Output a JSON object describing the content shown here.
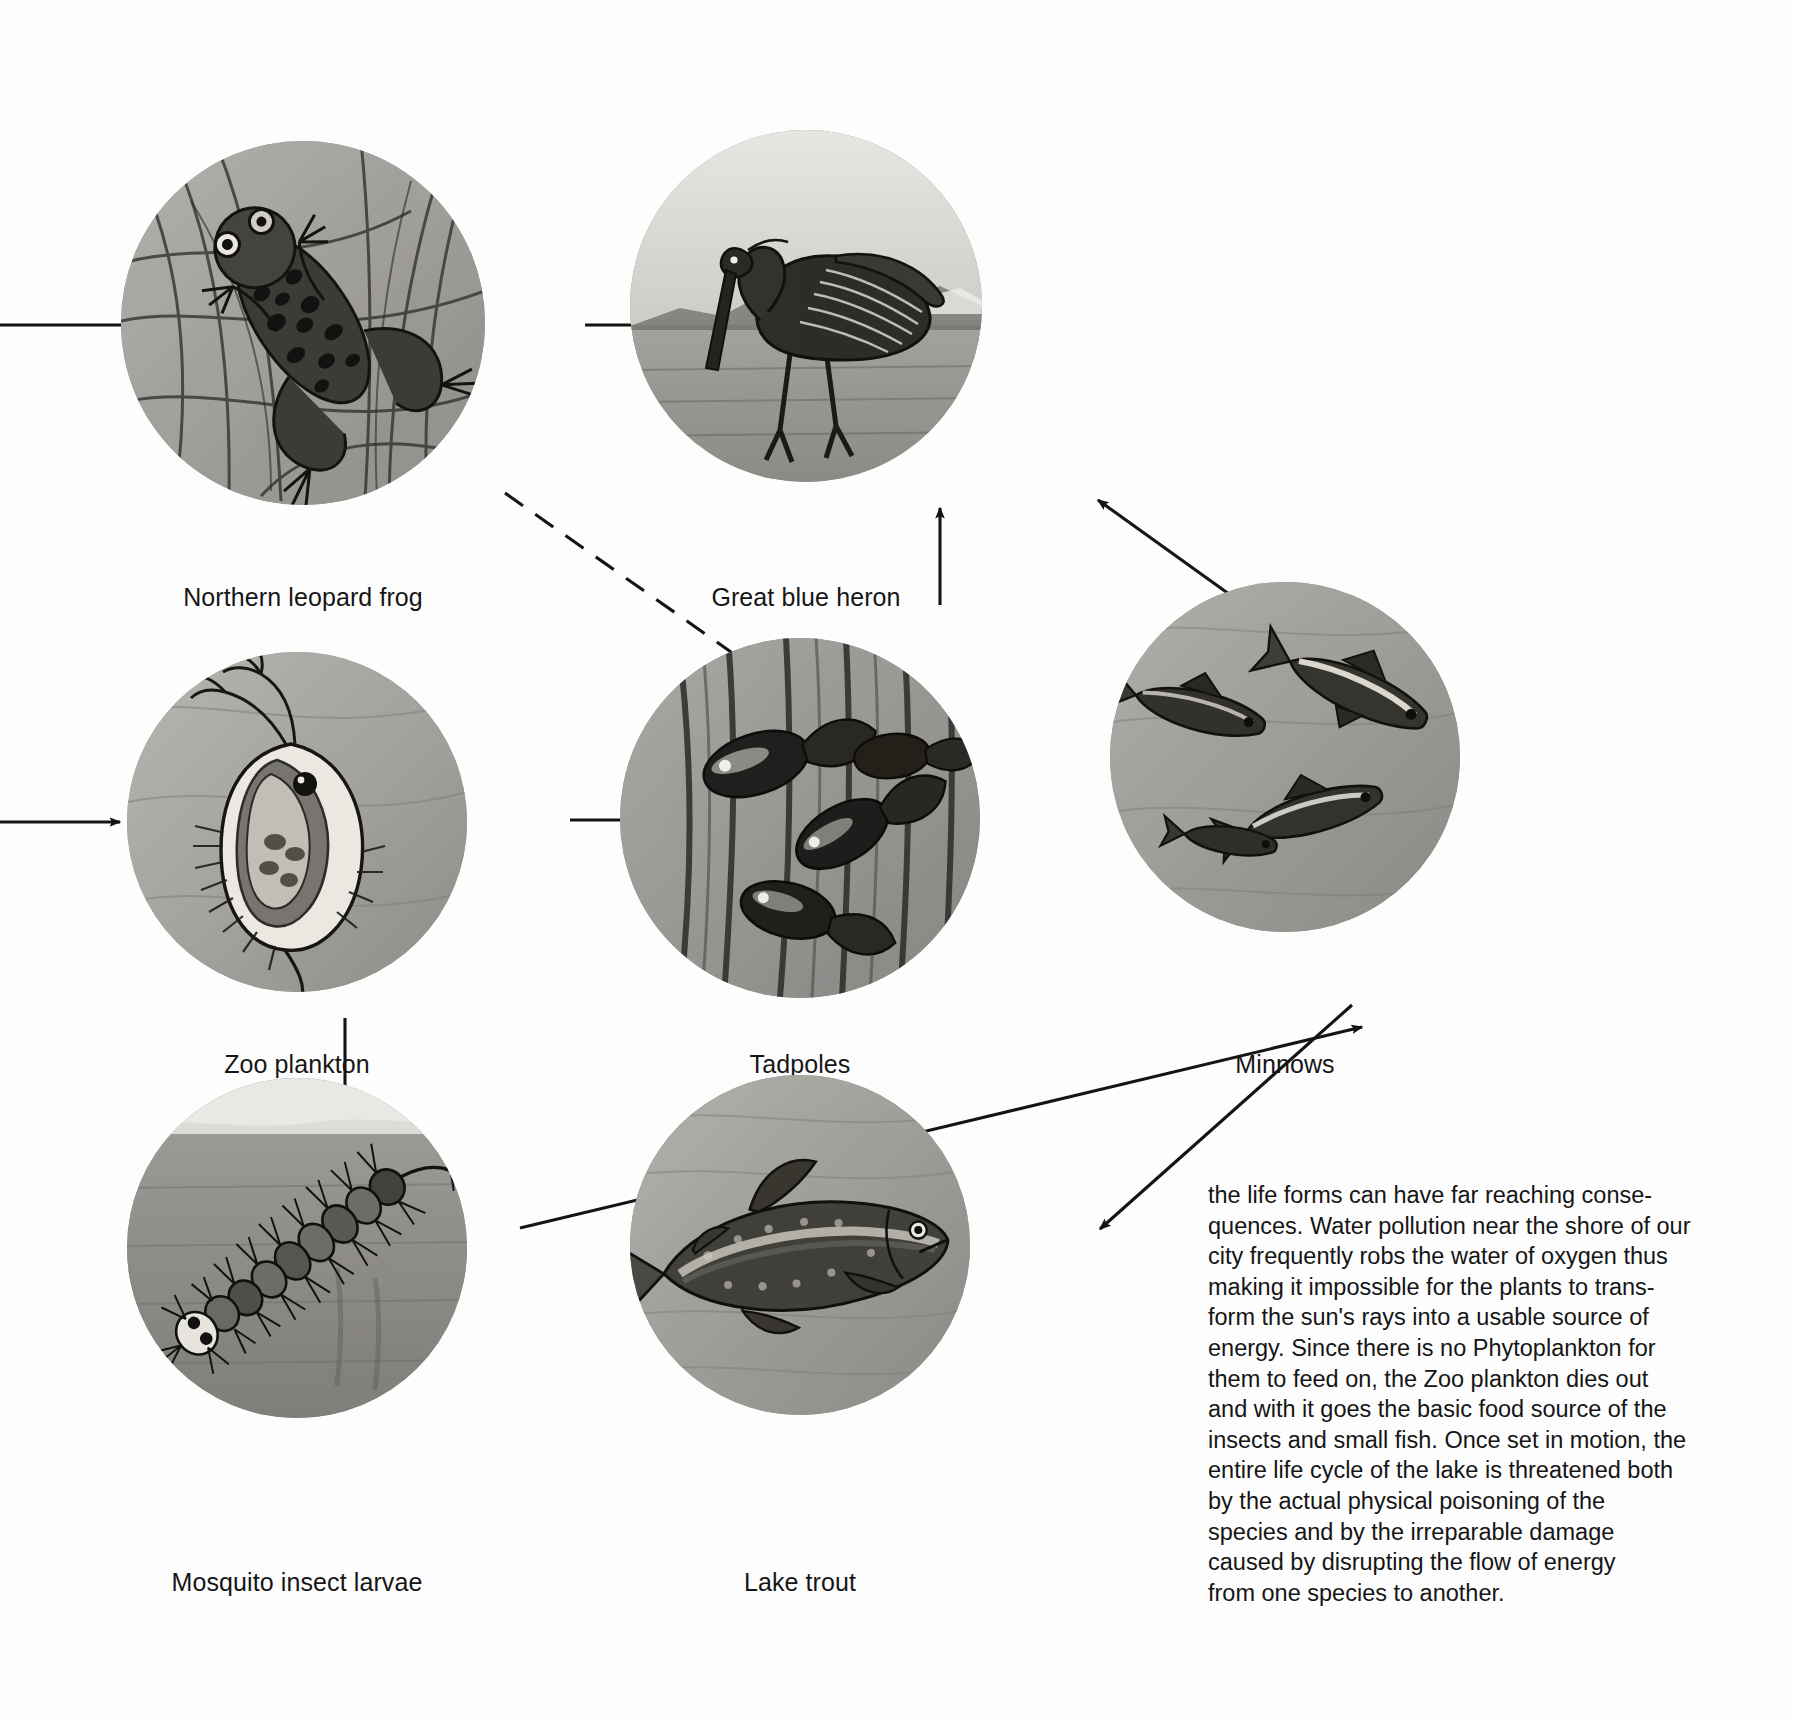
{
  "diagram": {
    "background_color": "#fdfdfd",
    "line_color": "#141414"
  },
  "nodes": [
    {
      "id": "northern-leopard-frog",
      "label": "Northern leopard frog",
      "image": "frog-in-reeds-photo",
      "cx": 303,
      "cy": 323,
      "r": 182,
      "caption_x": 303,
      "caption_y": 583
    },
    {
      "id": "great-blue-heron",
      "label": "Great blue heron",
      "image": "heron-wading-photo",
      "cx": 806,
      "cy": 306,
      "r": 176,
      "caption_x": 806,
      "caption_y": 583
    },
    {
      "id": "zoo-plankton",
      "label": "Zoo plankton",
      "image": "daphnia-zooplankton-photo",
      "cx": 297,
      "cy": 822,
      "r": 170,
      "caption_x": 297,
      "caption_y": 1050
    },
    {
      "id": "tadpoles",
      "label": "Tadpoles",
      "image": "tadpoles-in-reeds-photo",
      "cx": 800,
      "cy": 818,
      "r": 180,
      "caption_x": 800,
      "caption_y": 1050
    },
    {
      "id": "minnows",
      "label": "Minnows",
      "image": "three-minnows-photo",
      "cx": 1285,
      "cy": 757,
      "r": 175,
      "caption_x": 1285,
      "caption_y": 1050
    },
    {
      "id": "mosquito-insect-larvae",
      "label": "Mosquito insect larvae",
      "image": "mosquito-larva-photo",
      "cx": 297,
      "cy": 1248,
      "r": 170,
      "caption_x": 297,
      "caption_y": 1568
    },
    {
      "id": "lake-trout",
      "label": "Lake trout",
      "image": "lake-trout-photo",
      "cx": 800,
      "cy": 1245,
      "r": 170,
      "caption_x": 800,
      "caption_y": 1568
    }
  ],
  "connections": [
    {
      "id": "inflow-to-frog",
      "from": "offscreen-left",
      "to": "northern-leopard-frog",
      "style": "solid",
      "arrowhead": false
    },
    {
      "id": "frog-to-heron",
      "from": "northern-leopard-frog",
      "to": "great-blue-heron",
      "style": "solid",
      "arrowhead": true
    },
    {
      "id": "frog-to-tadpoles",
      "from": "northern-leopard-frog",
      "to": "tadpoles",
      "style": "dashed",
      "arrowhead": false
    },
    {
      "id": "inflow-to-zooplankton",
      "from": "offscreen-left",
      "to": "zoo-plankton",
      "style": "solid",
      "arrowhead": true
    },
    {
      "id": "zooplankton-to-tadpoles",
      "from": "zoo-plankton",
      "to": "tadpoles",
      "style": "solid",
      "arrowhead": true
    },
    {
      "id": "zooplankton-to-larvae",
      "from": "zoo-plankton",
      "to": "mosquito-insect-larvae",
      "style": "solid",
      "arrowhead": true
    },
    {
      "id": "tadpoles-to-heron",
      "from": "tadpoles",
      "to": "great-blue-heron",
      "style": "solid",
      "arrowhead": true
    },
    {
      "id": "minnows-to-heron",
      "from": "minnows",
      "to": "great-blue-heron",
      "style": "solid",
      "arrowhead": true
    },
    {
      "id": "larvae-to-minnows",
      "from": "mosquito-insect-larvae",
      "to": "minnows",
      "style": "solid",
      "arrowhead": true
    },
    {
      "id": "minnows-to-lake-trout",
      "from": "minnows",
      "to": "lake-trout",
      "style": "solid",
      "arrowhead": true
    }
  ],
  "body_text": {
    "paragraph": "the life forms can have far reaching conse-quences. Water pollution near the shore of our city frequently robs the water of oxygen thus making it impossible for the plants to trans-form the sun's rays into a usable source of energy. Since there is no Phytoplankton for them to feed on, the Zoo plankton dies out and with it goes the basic food source of the insects and small fish. Once set in motion, the entire life cycle of the lake is threatened both by the actual physical poisoning of the species and by the irreparable damage caused by disrupting the flow of energy from one species to another.",
    "lines": [
      "the life forms can have far reaching conse-",
      "quences. Water pollution near the shore of our",
      "city frequently robs the water of oxygen thus",
      "making it impossible for the plants to trans-",
      "form the sun's rays into a usable source of",
      "energy. Since there is no Phytoplankton for",
      "them to feed on, the Zoo plankton dies out",
      "and with it goes the basic food source of the",
      "insects and small fish. Once set in motion, the",
      "entire life cycle of the lake is threatened both",
      "by the actual physical poisoning of the",
      "species and by the irreparable damage",
      "caused by disrupting the flow of energy",
      "from one species to another."
    ]
  }
}
